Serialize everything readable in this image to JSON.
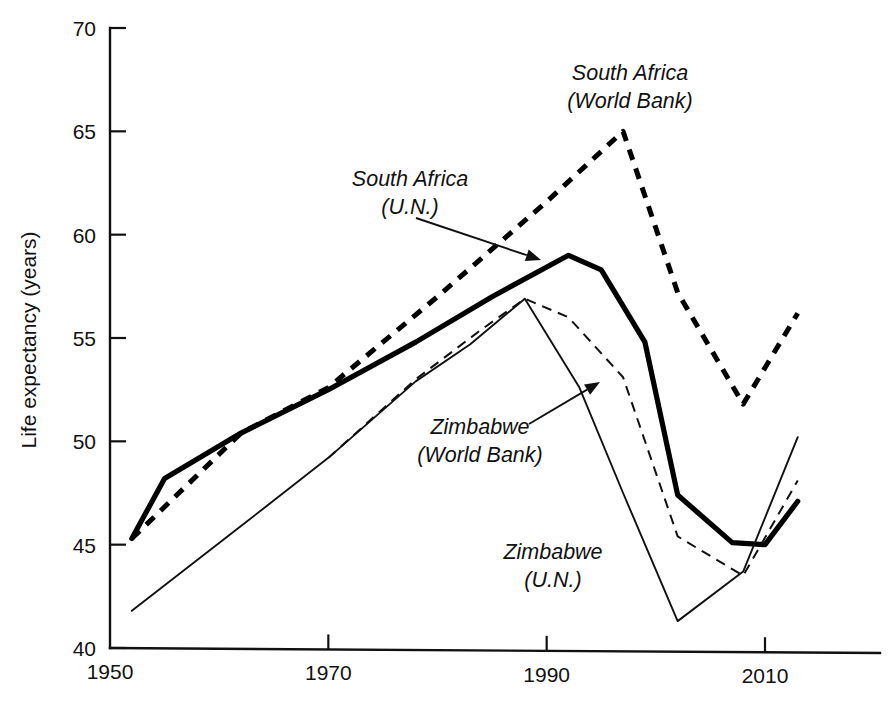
{
  "chart_data": {
    "type": "line",
    "title": "",
    "xlabel": "",
    "ylabel": "Life expectancy (years)",
    "xlim": [
      1950,
      2014
    ],
    "ylim": [
      40,
      70
    ],
    "xticks": [
      1950,
      1970,
      1990,
      2010
    ],
    "xticklabels": [
      "1950",
      "1970",
      "1990",
      "2010"
    ],
    "yticks": [
      40,
      45,
      50,
      55,
      60,
      65,
      70
    ],
    "yticklabels": [
      "40",
      "45",
      "50",
      "55",
      "60",
      "65",
      "70"
    ],
    "grid": false,
    "legend_position": "inline-annotations",
    "series": [
      {
        "name": "South Africa (U.N.)",
        "style": "thick-solid",
        "x": [
          1952,
          1955,
          1962,
          1970,
          1978,
          1985,
          1992,
          1995,
          1999,
          2002,
          2007,
          2010,
          2013
        ],
        "y": [
          45.3,
          48.2,
          50.4,
          52.5,
          54.8,
          57.0,
          59.0,
          58.3,
          54.8,
          47.4,
          45.1,
          45.0,
          47.1
        ]
      },
      {
        "name": "South Africa (World Bank)",
        "style": "thick-dashed",
        "x": [
          1952,
          1962,
          1970,
          1980,
          1990,
          1997,
          2002,
          2008,
          2013
        ],
        "y": [
          45.3,
          50.4,
          52.6,
          57.0,
          61.6,
          65.0,
          57.2,
          51.8,
          56.2
        ]
      },
      {
        "name": "Zimbabwe (U.N.)",
        "style": "thin-solid",
        "x": [
          1952,
          1962,
          1970,
          1978,
          1983,
          1988,
          1993,
          1997,
          2002,
          2008,
          2013
        ],
        "y": [
          41.8,
          45.9,
          49.2,
          52.9,
          54.7,
          56.9,
          52.6,
          47.5,
          41.3,
          43.7,
          50.2
        ]
      },
      {
        "name": "Zimbabwe (World Bank)",
        "style": "thin-dashed",
        "x": [
          1970,
          1978,
          1984,
          1988,
          1992,
          1997,
          2002,
          2008,
          2013
        ],
        "y": [
          49.2,
          53.0,
          55.4,
          56.9,
          56.0,
          53.1,
          45.4,
          43.5,
          48.1
        ]
      }
    ],
    "annotations": [
      {
        "id": "south-africa-world-bank",
        "line1": "South Africa",
        "line2": "(World Bank)",
        "text_x": 630,
        "text_y": 80,
        "has_leader": false
      },
      {
        "id": "south-africa-un",
        "line1": "South Africa",
        "line2": "(U.N.)",
        "text_x": 410,
        "text_y": 186,
        "has_leader": true,
        "leader_from_x": 416,
        "leader_from_y": 218,
        "leader_to_x": 541,
        "leader_to_y": 260
      },
      {
        "id": "zimbabwe-world-bank",
        "line1": "Zimbabwe",
        "line2": "(World Bank)",
        "text_x": 480,
        "text_y": 434,
        "has_leader": true,
        "leader_from_x": 529,
        "leader_from_y": 424,
        "leader_to_x": 600,
        "leader_to_y": 382
      },
      {
        "id": "zimbabwe-un",
        "line1": "Zimbabwe",
        "line2": "(U.N.)",
        "text_x": 553,
        "text_y": 559,
        "has_leader": false
      }
    ],
    "colors": {
      "ink": "#111111",
      "background": "#ffffff"
    }
  }
}
